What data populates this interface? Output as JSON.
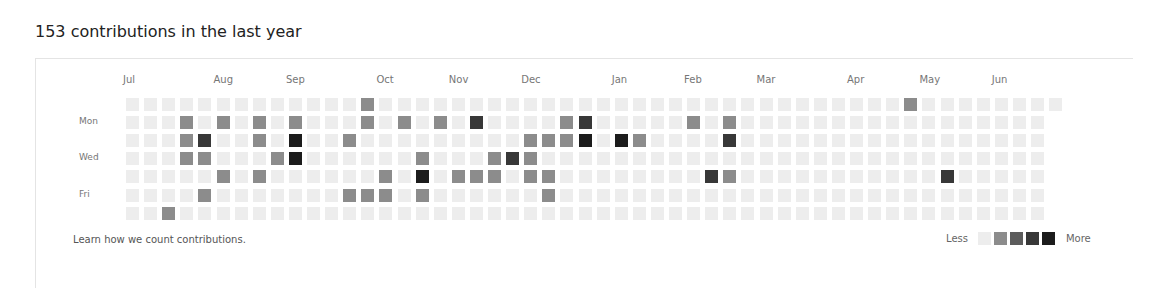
{
  "header": {
    "title": "153 contributions in the last year"
  },
  "months": [
    {
      "label": "Jul",
      "week": 0
    },
    {
      "label": "Aug",
      "week": 5
    },
    {
      "label": "Sep",
      "week": 9
    },
    {
      "label": "Oct",
      "week": 14
    },
    {
      "label": "Nov",
      "week": 18
    },
    {
      "label": "Dec",
      "week": 22
    },
    {
      "label": "Jan",
      "week": 27
    },
    {
      "label": "Feb",
      "week": 31
    },
    {
      "label": "Mar",
      "week": 35
    },
    {
      "label": "Apr",
      "week": 40
    },
    {
      "label": "May",
      "week": 44
    },
    {
      "label": "Jun",
      "week": 48
    }
  ],
  "day_labels": [
    {
      "label": "Mon",
      "row": 1
    },
    {
      "label": "Wed",
      "row": 3
    },
    {
      "label": "Fri",
      "row": 5
    }
  ],
  "grid": {
    "weeks": 52,
    "last_week_days": 1,
    "active_cells": [
      {
        "week": 2,
        "day": 6,
        "level": 1
      },
      {
        "week": 3,
        "day": 1,
        "level": 1
      },
      {
        "week": 3,
        "day": 2,
        "level": 1
      },
      {
        "week": 3,
        "day": 3,
        "level": 1
      },
      {
        "week": 4,
        "day": 2,
        "level": 3
      },
      {
        "week": 4,
        "day": 3,
        "level": 1
      },
      {
        "week": 4,
        "day": 5,
        "level": 1
      },
      {
        "week": 5,
        "day": 1,
        "level": 1
      },
      {
        "week": 5,
        "day": 4,
        "level": 1
      },
      {
        "week": 7,
        "day": 1,
        "level": 1
      },
      {
        "week": 7,
        "day": 2,
        "level": 1
      },
      {
        "week": 7,
        "day": 4,
        "level": 1
      },
      {
        "week": 8,
        "day": 3,
        "level": 1
      },
      {
        "week": 9,
        "day": 1,
        "level": 1
      },
      {
        "week": 9,
        "day": 2,
        "level": 4
      },
      {
        "week": 9,
        "day": 3,
        "level": 4
      },
      {
        "week": 12,
        "day": 2,
        "level": 1
      },
      {
        "week": 12,
        "day": 5,
        "level": 1
      },
      {
        "week": 13,
        "day": 0,
        "level": 1
      },
      {
        "week": 13,
        "day": 1,
        "level": 1
      },
      {
        "week": 13,
        "day": 5,
        "level": 1
      },
      {
        "week": 14,
        "day": 4,
        "level": 1
      },
      {
        "week": 14,
        "day": 5,
        "level": 1
      },
      {
        "week": 15,
        "day": 1,
        "level": 1
      },
      {
        "week": 16,
        "day": 3,
        "level": 1
      },
      {
        "week": 16,
        "day": 4,
        "level": 4
      },
      {
        "week": 16,
        "day": 5,
        "level": 1
      },
      {
        "week": 17,
        "day": 1,
        "level": 1
      },
      {
        "week": 18,
        "day": 4,
        "level": 1
      },
      {
        "week": 19,
        "day": 1,
        "level": 3
      },
      {
        "week": 19,
        "day": 4,
        "level": 1
      },
      {
        "week": 20,
        "day": 3,
        "level": 1
      },
      {
        "week": 20,
        "day": 4,
        "level": 1
      },
      {
        "week": 21,
        "day": 3,
        "level": 3
      },
      {
        "week": 22,
        "day": 2,
        "level": 1
      },
      {
        "week": 22,
        "day": 3,
        "level": 1
      },
      {
        "week": 22,
        "day": 4,
        "level": 1
      },
      {
        "week": 23,
        "day": 2,
        "level": 1
      },
      {
        "week": 23,
        "day": 4,
        "level": 1
      },
      {
        "week": 23,
        "day": 5,
        "level": 1
      },
      {
        "week": 24,
        "day": 1,
        "level": 1
      },
      {
        "week": 24,
        "day": 2,
        "level": 1
      },
      {
        "week": 25,
        "day": 1,
        "level": 3
      },
      {
        "week": 25,
        "day": 2,
        "level": 4
      },
      {
        "week": 27,
        "day": 2,
        "level": 4
      },
      {
        "week": 28,
        "day": 2,
        "level": 1
      },
      {
        "week": 31,
        "day": 1,
        "level": 1
      },
      {
        "week": 32,
        "day": 4,
        "level": 3
      },
      {
        "week": 33,
        "day": 1,
        "level": 1
      },
      {
        "week": 33,
        "day": 2,
        "level": 3
      },
      {
        "week": 33,
        "day": 4,
        "level": 1
      },
      {
        "week": 43,
        "day": 0,
        "level": 1
      },
      {
        "week": 45,
        "day": 4,
        "level": 3
      }
    ]
  },
  "colors": {
    "level0": "#ededed",
    "level1": "#8c8c8c",
    "level2": "#5c5c5c",
    "level3": "#383838",
    "level4": "#1c1c1c"
  },
  "footer": {
    "learn_link": "Learn how we count contributions.",
    "legend_less": "Less",
    "legend_more": "More",
    "legend_levels": [
      0,
      1,
      2,
      3,
      4
    ]
  }
}
